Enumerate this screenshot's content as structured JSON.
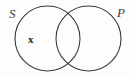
{
  "diagram": {
    "type": "venn-two-circle",
    "background_color": "#fdfdfd",
    "stroke_color": "#3a3a3a",
    "stroke_width": 1.1,
    "width": 134,
    "height": 76,
    "circles": [
      {
        "name": "subject-circle",
        "label": "S",
        "cx": 47.5,
        "cy": 38.5,
        "r": 32.5
      },
      {
        "name": "predicate-circle",
        "label": "P",
        "cx": 88.5,
        "cy": 38.5,
        "r": 32.5
      }
    ],
    "labels": {
      "left": "S",
      "right": "P"
    },
    "marks": [
      {
        "name": "x-mark",
        "text": "x",
        "region": "S-only",
        "x": 32,
        "y": 40
      }
    ]
  }
}
